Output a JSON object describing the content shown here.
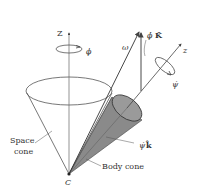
{
  "diagram": {
    "type": "rigid-body-precession",
    "labels": {
      "space_z_axis": "Z",
      "space_z_rotation": "ϕ",
      "omega": "ω",
      "phi_dot_K": "ϕ̇",
      "K_hat": "K̂",
      "body_z_axis": "z",
      "body_z_rotation": "ψ̇",
      "psi_dot_k": "ψ̇",
      "k_hat": "k̂",
      "space_cone_line1": "Space",
      "space_cone_line2": "cone",
      "body_cone": "Body cone",
      "apex": "C"
    },
    "colors": {
      "line": "#555555",
      "body_cone_fill": "#8a8a8a",
      "body_cone_dark": "#6e6e6e",
      "text": "#333333"
    }
  }
}
